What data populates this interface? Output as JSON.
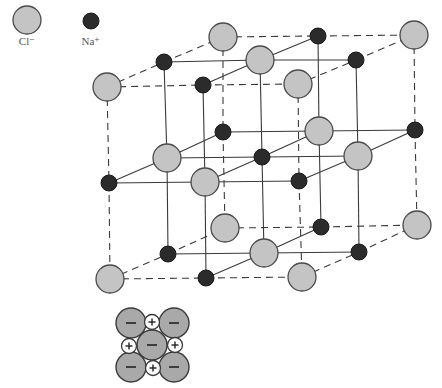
{
  "colors": {
    "cl_fill": "#c4c4c4",
    "cl_stroke": "#4a4a4a",
    "na_fill": "#2b2b2b",
    "na_stroke": "#1a1a1a",
    "line": "#3a3a3a",
    "inset_anion_fill": "#a9a9a9",
    "inset_cation_fill": "#ffffff"
  },
  "legend": [
    {
      "ion": "Cl",
      "label": "Cl⁻",
      "x": 27,
      "y": 20,
      "r": 14,
      "label_y": 35
    },
    {
      "ion": "Na",
      "label": "Na⁺",
      "x": 91,
      "y": 21,
      "r": 8,
      "label_y": 35
    }
  ],
  "lattice": {
    "cl_radius": 14,
    "na_radius": 8,
    "nodes": [
      [
        [
          [
            "Cl",
            107,
            87
          ],
          [
            "Na",
            203,
            85
          ],
          [
            "Cl",
            298,
            84
          ]
        ],
        [
          [
            "Na",
            164,
            62
          ],
          [
            "Cl",
            260,
            60
          ],
          [
            "Na",
            356,
            60
          ]
        ],
        [
          [
            "Cl",
            223,
            37
          ],
          [
            "Na",
            318,
            36
          ],
          [
            "Cl",
            414,
            35
          ]
        ]
      ],
      [
        [
          [
            "Na",
            109,
            183
          ],
          [
            "Cl",
            205,
            182
          ],
          [
            "Na",
            299,
            181
          ]
        ],
        [
          [
            "Cl",
            167,
            158
          ],
          [
            "Na",
            262,
            157
          ],
          [
            "Cl",
            358,
            156
          ]
        ],
        [
          [
            "Na",
            223,
            132
          ],
          [
            "Cl",
            319,
            131
          ],
          [
            "Na",
            415,
            130
          ]
        ]
      ],
      [
        [
          [
            "Cl",
            110,
            279
          ],
          [
            "Na",
            206,
            278
          ],
          [
            "Cl",
            302,
            277
          ]
        ],
        [
          [
            "Na",
            168,
            254
          ],
          [
            "Cl",
            264,
            253
          ],
          [
            "Na",
            359,
            252
          ]
        ],
        [
          [
            "Cl",
            225,
            228
          ],
          [
            "Na",
            321,
            227
          ],
          [
            "Cl",
            417,
            225
          ]
        ]
      ]
    ],
    "edge_style": {
      "outer": "dashed",
      "inner": "solid"
    }
  },
  "inset": {
    "anions": [
      {
        "x": 131,
        "y": 323,
        "sign": "−"
      },
      {
        "x": 174,
        "y": 323,
        "sign": "−"
      },
      {
        "x": 152,
        "y": 345,
        "sign": "−"
      },
      {
        "x": 131,
        "y": 367,
        "sign": "−"
      },
      {
        "x": 174,
        "y": 367,
        "sign": "−"
      }
    ],
    "cations": [
      {
        "x": 152,
        "y": 322,
        "sign": "+"
      },
      {
        "x": 129,
        "y": 346,
        "sign": "+"
      },
      {
        "x": 175,
        "y": 345,
        "sign": "+"
      },
      {
        "x": 153,
        "y": 368,
        "sign": "+"
      }
    ],
    "anion_r": 15,
    "cation_r": 7.5
  }
}
